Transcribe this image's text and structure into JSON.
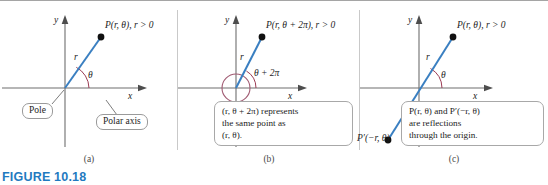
{
  "figure": {
    "caption": "FIGURE 10.18",
    "caption_color": "#1f7ac0",
    "ray_color": "#3a7fc1",
    "arc_color": "#9b3b53",
    "highlight_circle_color": "#a05a72",
    "axis_color": "#6e6e6e",
    "point_color": "#111111"
  },
  "panels": [
    {
      "id": "a",
      "label": "(a)",
      "axis_x_label": "x",
      "axis_y_label": "y",
      "point_label": "P(r, θ), r > 0",
      "radius_label": "r",
      "angle_label": "θ",
      "callouts": [
        {
          "name": "pole",
          "text": "Pole"
        },
        {
          "name": "polar-axis",
          "text": "Polar axis"
        }
      ]
    },
    {
      "id": "b",
      "label": "(b)",
      "axis_x_label": "x",
      "axis_y_label": "y",
      "point_label": "P(r, θ + 2π), r > 0",
      "radius_label": "r",
      "angle_label": "θ + 2π",
      "note_lines": [
        "(r, θ + 2π) represents",
        "the same point as",
        "(r, θ)."
      ]
    },
    {
      "id": "c",
      "label": "(c)",
      "axis_x_label": "x",
      "axis_y_label": "y",
      "point_label": "P(r, θ), r > 0",
      "reflected_point_label": "P′(−r, θ)",
      "radius_label": "r",
      "angle_label": "θ",
      "note_lines": [
        "P(r, θ) and P′(−r, θ)",
        "are reflections",
        "through the origin."
      ]
    }
  ]
}
